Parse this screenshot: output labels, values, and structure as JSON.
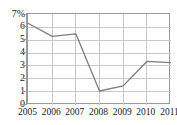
{
  "chart_data": {
    "type": "line",
    "title": "",
    "subtitle": "",
    "xlabel": "",
    "ylabel": "",
    "categories": [
      "2005",
      "2006",
      "2007",
      "2008",
      "2009",
      "2010",
      "2011"
    ],
    "x": [
      2005,
      2006,
      2007,
      2008,
      2009,
      2010,
      2011
    ],
    "values": [
      6.3,
      5.3,
      5.5,
      1.05,
      1.45,
      3.35,
      3.25
    ],
    "series": [
      {
        "name": "",
        "values": [
          6.3,
          5.3,
          5.5,
          1.05,
          1.45,
          3.35,
          3.25
        ]
      }
    ],
    "ylim": [
      0,
      7
    ],
    "xlim": [
      2005,
      2011
    ],
    "y_ticks": [
      0,
      1,
      2,
      3,
      4,
      5,
      6,
      7
    ],
    "y_tick_labels": [
      "0",
      "1",
      "2",
      "3",
      "4",
      "5",
      "6",
      "7%"
    ],
    "x_ticks": [
      2005,
      2006,
      2007,
      2008,
      2009,
      2010,
      2011
    ],
    "x_tick_labels": [
      "2005",
      "2006",
      "2007",
      "2008",
      "2009",
      "2010",
      "2011"
    ],
    "grid": true,
    "grid_axis": "both",
    "legend": false,
    "legend_position": "none",
    "annotations": [],
    "unit": "%"
  },
  "style": {
    "background_color": "#ffffff",
    "line_color": "#7d7d7d",
    "grid_color": "#c8c8c8",
    "border_color": "#9a9a9a",
    "tick_label_color": "#1a1a1a"
  }
}
